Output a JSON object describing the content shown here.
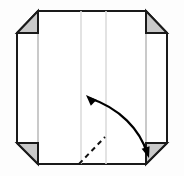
{
  "figure": {
    "background_color": "#fdfdfd",
    "paper_fill": "#ffffff",
    "outline_color": "#1a1a1a",
    "corner_flap_fill": "#c9c9c9",
    "crease_line_color": "#d6d6d6",
    "dashed_line_color": "#111111",
    "arrow_color": "#000000",
    "outline_width": 2,
    "crease_width": 1.6,
    "dashed_width": 2
  },
  "geometry": {
    "sheet": {
      "left": 17,
      "right": 167,
      "top": 11,
      "bottom": 164,
      "corner_cut": 22
    },
    "outline_points": "38,11 146,11 167,33 167,143 146,164 38,164 17,143 17,33",
    "corner_flaps": [
      {
        "name": "top-left-flap",
        "points": "17,33 38,33 38,11"
      },
      {
        "name": "top-right-flap",
        "points": "167,33 146,33 146,11"
      },
      {
        "name": "bottom-left-flap",
        "points": "17,143 38,143 38,164"
      },
      {
        "name": "bottom-right-flap",
        "points": "167,143 146,143 146,164"
      }
    ],
    "flap_edges": [
      {
        "name": "top-left-flap-edge",
        "x1": 17,
        "y1": 33,
        "x2": 38,
        "y2": 33
      },
      {
        "name": "top-right-flap-edge",
        "x1": 146,
        "y1": 33,
        "x2": 167,
        "y2": 33
      },
      {
        "name": "bottom-left-flap-edge",
        "x1": 17,
        "y1": 143,
        "x2": 38,
        "y2": 143
      },
      {
        "name": "bottom-right-flap-edge",
        "x1": 146,
        "y1": 143,
        "x2": 167,
        "y2": 143
      }
    ],
    "crease_lines": [
      {
        "name": "crease-left-outer",
        "x": 38,
        "y1": 11,
        "y2": 164,
        "color": "#bdbdbd"
      },
      {
        "name": "crease-center-left",
        "x": 81,
        "y1": 11,
        "y2": 164,
        "color": "#dcdcdc"
      },
      {
        "name": "crease-center-right",
        "x": 106,
        "y1": 11,
        "y2": 164,
        "color": "#dcdcdc"
      },
      {
        "name": "crease-right-outer",
        "x": 146,
        "y1": 11,
        "y2": 164,
        "color": "#bdbdbd"
      }
    ],
    "dashed_fold": {
      "name": "dashed-fold-line",
      "x1": 79,
      "y1": 164,
      "x2": 105,
      "y2": 137,
      "dash_pattern": "5,4"
    },
    "curved_arrow": {
      "name": "double-headed-curved-arrow",
      "path": "M 89,98 C 120,108 140,130 147,153",
      "head_start": {
        "x": 86,
        "y": 95,
        "angle": -135
      },
      "head_end": {
        "x": 149,
        "y": 158,
        "angle": 72
      },
      "head_size": 11,
      "stroke_width": 2.2
    }
  },
  "labels": {
    "step_number": "",
    "note": ""
  }
}
